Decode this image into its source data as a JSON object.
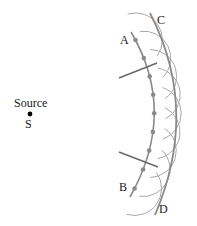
{
  "figure": {
    "labels": {
      "source": "Source",
      "source_point": "S",
      "a": "A",
      "b": "B",
      "c": "C",
      "d": "D"
    },
    "wavefront_ab": {
      "secondary_source_count": 9
    },
    "rays": {
      "count": 2
    },
    "colors": {
      "wavefront": "#8a8a8a",
      "wavelet": "#a8a8a8",
      "ray": "#6a6a6a",
      "source": "#000000",
      "text": "#1a1a1a"
    }
  }
}
